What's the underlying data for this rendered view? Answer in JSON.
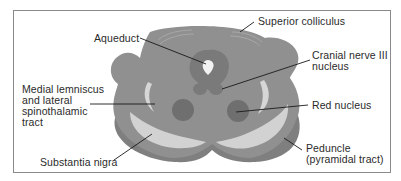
{
  "figure": {
    "labels": {
      "superior_colliculus": "Superior colliculus",
      "aqueduct": "Aqueduct",
      "cranial_nerve_iii": "Cranial nerve III\nnucleus",
      "medial_lemniscus": "Medial lemniscus\nand lateral\nspinothalamic\ntract",
      "red_nucleus": "Red nucleus",
      "peduncle": "Peduncle\n(pyramidal tract)",
      "substantia_nigra": "Substantia nigra"
    },
    "colors": {
      "tissue": "#8f8f8f",
      "tissue_dark": "#767676",
      "periaqueductal": "#7d7d7d",
      "red_nucleus": "#6e6e6e",
      "substantia_nigra": "#d2d2d2",
      "peduncle": "#7f7f7f",
      "leader_line": "#1a1a1a",
      "frame": "#8a8a8a"
    }
  }
}
